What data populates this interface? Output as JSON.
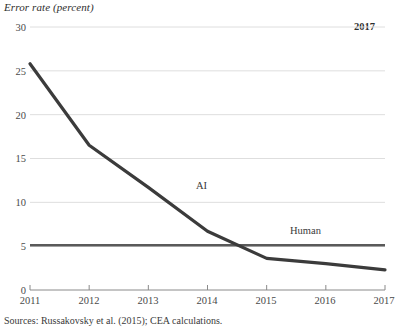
{
  "chart_data": {
    "type": "line",
    "title": "Error rate (percent)",
    "xlabel": "",
    "ylabel": "Error rate (percent)",
    "x": [
      2011,
      2012,
      2013,
      2014,
      2015,
      2016,
      2017
    ],
    "xtick_labels": [
      "2011",
      "2012",
      "2013",
      "2014",
      "2015",
      "2016",
      "2017"
    ],
    "ytick_labels": [
      "30",
      "25",
      "20",
      "15",
      "10",
      "5",
      "0"
    ],
    "ytick_values": [
      30,
      25,
      20,
      15,
      10,
      5,
      0
    ],
    "xlim": [
      2011,
      2017
    ],
    "ylim": [
      0,
      30
    ],
    "grid": "horizontal",
    "legend": "inline-annotations",
    "series": [
      {
        "name": "AI",
        "label": "AI",
        "color": "#3b3b3b",
        "values": [
          25.8,
          16.5,
          11.7,
          6.7,
          3.6,
          3.0,
          2.3
        ]
      },
      {
        "name": "Human",
        "label": "Human",
        "color": "#5a5a5a",
        "values": [
          5.1,
          5.1,
          5.1,
          5.1,
          5.1,
          5.1,
          5.1
        ]
      }
    ],
    "annotations": [
      {
        "name": "ai-label",
        "text": "AI",
        "x": 2014.35,
        "y": 13.3
      },
      {
        "name": "human-label",
        "text": "Human",
        "x": 2016.2,
        "y": 7.9
      },
      {
        "name": "end-year-note",
        "text": "2017",
        "x": 2016.9,
        "y": 29.2
      }
    ],
    "source": "Sources: Russakovsky et al. (2015); CEA calculations."
  },
  "colors": {
    "ai_line": "#3b3b3b",
    "human_line": "#5a5a5a",
    "gridline": "#dedede",
    "axis": "#8a8a8a",
    "text": "#3a3a3a"
  }
}
